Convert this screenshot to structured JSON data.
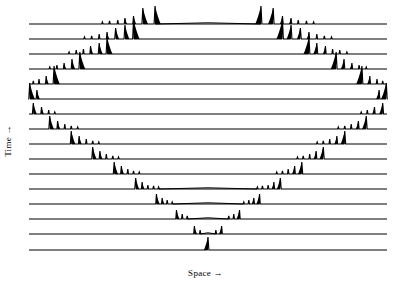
{
  "figure": {
    "title": "",
    "background_color": "#ffffff",
    "line_color": "#000000"
  },
  "axes": {
    "x_label": "Space →",
    "y_label": "Time →",
    "x_tick_labels": [],
    "y_tick_labels": [],
    "grid": false
  },
  "chart_data": {
    "type": "line",
    "title": "",
    "subtitle": "",
    "xlabel": "Space →",
    "ylabel": "Time →",
    "legend": [],
    "legend_position": "none",
    "xlim": [
      0,
      1
    ],
    "ylim": [
      0,
      16
    ],
    "grid": false,
    "n_traces": 16,
    "trace_order": "bottom row is earliest time; top row is latest time",
    "x_domain_px": [
      29,
      387
    ],
    "baseline_y_px": [
      24,
      39,
      54,
      69,
      84,
      99,
      114,
      129,
      144,
      159,
      174,
      189,
      204,
      219,
      234,
      250
    ],
    "max_spike_px": 22,
    "traces": [
      {
        "index": 0,
        "time_step": 15,
        "baseline_y": 24,
        "spikes": [
          {
            "x": 0.205,
            "h": 2
          },
          {
            "x": 0.225,
            "h": 3
          },
          {
            "x": 0.248,
            "h": 4
          },
          {
            "x": 0.268,
            "h": 6
          },
          {
            "x": 0.292,
            "h": 8
          },
          {
            "x": 0.318,
            "h": 16
          },
          {
            "x": 0.352,
            "h": 18
          },
          {
            "x": 0.648,
            "h": 18
          },
          {
            "x": 0.682,
            "h": 16
          },
          {
            "x": 0.708,
            "h": 8
          },
          {
            "x": 0.732,
            "h": 6
          },
          {
            "x": 0.752,
            "h": 4
          },
          {
            "x": 0.775,
            "h": 3
          },
          {
            "x": 0.795,
            "h": 2
          }
        ]
      },
      {
        "index": 1,
        "time_step": 14,
        "baseline_y": 39,
        "spikes": [
          {
            "x": 0.155,
            "h": 2
          },
          {
            "x": 0.175,
            "h": 3
          },
          {
            "x": 0.196,
            "h": 5
          },
          {
            "x": 0.218,
            "h": 7
          },
          {
            "x": 0.242,
            "h": 11
          },
          {
            "x": 0.268,
            "h": 14
          },
          {
            "x": 0.292,
            "h": 19
          },
          {
            "x": 0.708,
            "h": 19
          },
          {
            "x": 0.732,
            "h": 14
          },
          {
            "x": 0.758,
            "h": 11
          },
          {
            "x": 0.782,
            "h": 7
          },
          {
            "x": 0.804,
            "h": 5
          },
          {
            "x": 0.825,
            "h": 3
          },
          {
            "x": 0.845,
            "h": 2
          }
        ]
      },
      {
        "index": 2,
        "time_step": 13,
        "baseline_y": 54,
        "spikes": [
          {
            "x": 0.112,
            "h": 2
          },
          {
            "x": 0.132,
            "h": 4
          },
          {
            "x": 0.152,
            "h": 5
          },
          {
            "x": 0.172,
            "h": 8
          },
          {
            "x": 0.196,
            "h": 11
          },
          {
            "x": 0.218,
            "h": 17
          },
          {
            "x": 0.782,
            "h": 17
          },
          {
            "x": 0.804,
            "h": 11
          },
          {
            "x": 0.828,
            "h": 8
          },
          {
            "x": 0.848,
            "h": 5
          },
          {
            "x": 0.868,
            "h": 4
          },
          {
            "x": 0.888,
            "h": 2
          }
        ]
      },
      {
        "index": 3,
        "time_step": 12,
        "baseline_y": 69,
        "spikes": [
          {
            "x": 0.058,
            "h": 2
          },
          {
            "x": 0.078,
            "h": 4
          },
          {
            "x": 0.098,
            "h": 6
          },
          {
            "x": 0.12,
            "h": 10
          },
          {
            "x": 0.142,
            "h": 17
          },
          {
            "x": 0.858,
            "h": 17
          },
          {
            "x": 0.88,
            "h": 10
          },
          {
            "x": 0.902,
            "h": 6
          },
          {
            "x": 0.922,
            "h": 4
          },
          {
            "x": 0.942,
            "h": 2
          }
        ]
      },
      {
        "index": 4,
        "time_step": 11,
        "baseline_y": 84,
        "spikes": [
          {
            "x": 0.012,
            "h": 3
          },
          {
            "x": 0.028,
            "h": 5
          },
          {
            "x": 0.048,
            "h": 8
          },
          {
            "x": 0.07,
            "h": 18
          },
          {
            "x": 0.93,
            "h": 18
          },
          {
            "x": 0.952,
            "h": 8
          },
          {
            "x": 0.972,
            "h": 5
          },
          {
            "x": 0.988,
            "h": 3
          }
        ]
      },
      {
        "index": 5,
        "time_step": 10,
        "baseline_y": 99,
        "spikes": [
          {
            "x": 0.002,
            "h": 16
          },
          {
            "x": 0.022,
            "h": 9
          },
          {
            "x": 0.978,
            "h": 9
          },
          {
            "x": 0.998,
            "h": 16
          }
        ]
      },
      {
        "index": 6,
        "time_step": 9,
        "baseline_y": 114,
        "spikes": [
          {
            "x": 0.012,
            "h": 11
          },
          {
            "x": 0.035,
            "h": 7
          },
          {
            "x": 0.055,
            "h": 4
          },
          {
            "x": 0.072,
            "h": 2
          },
          {
            "x": 0.928,
            "h": 2
          },
          {
            "x": 0.945,
            "h": 4
          },
          {
            "x": 0.965,
            "h": 7
          },
          {
            "x": 0.988,
            "h": 11
          }
        ]
      },
      {
        "index": 7,
        "time_step": 8,
        "baseline_y": 129,
        "spikes": [
          {
            "x": 0.058,
            "h": 13
          },
          {
            "x": 0.08,
            "h": 8
          },
          {
            "x": 0.1,
            "h": 5
          },
          {
            "x": 0.118,
            "h": 3
          },
          {
            "x": 0.136,
            "h": 2
          },
          {
            "x": 0.864,
            "h": 2
          },
          {
            "x": 0.882,
            "h": 3
          },
          {
            "x": 0.9,
            "h": 5
          },
          {
            "x": 0.92,
            "h": 8
          },
          {
            "x": 0.942,
            "h": 13
          }
        ]
      },
      {
        "index": 8,
        "time_step": 7,
        "baseline_y": 144,
        "spikes": [
          {
            "x": 0.118,
            "h": 13
          },
          {
            "x": 0.14,
            "h": 8
          },
          {
            "x": 0.16,
            "h": 5
          },
          {
            "x": 0.178,
            "h": 3
          },
          {
            "x": 0.195,
            "h": 2
          },
          {
            "x": 0.805,
            "h": 2
          },
          {
            "x": 0.822,
            "h": 3
          },
          {
            "x": 0.84,
            "h": 5
          },
          {
            "x": 0.86,
            "h": 8
          },
          {
            "x": 0.882,
            "h": 13
          }
        ]
      },
      {
        "index": 9,
        "time_step": 6,
        "baseline_y": 159,
        "spikes": [
          {
            "x": 0.178,
            "h": 12
          },
          {
            "x": 0.198,
            "h": 8
          },
          {
            "x": 0.216,
            "h": 5
          },
          {
            "x": 0.234,
            "h": 3
          },
          {
            "x": 0.25,
            "h": 2
          },
          {
            "x": 0.75,
            "h": 2
          },
          {
            "x": 0.766,
            "h": 3
          },
          {
            "x": 0.784,
            "h": 5
          },
          {
            "x": 0.802,
            "h": 8
          },
          {
            "x": 0.822,
            "h": 12
          }
        ]
      },
      {
        "index": 10,
        "time_step": 5,
        "baseline_y": 174,
        "spikes": [
          {
            "x": 0.238,
            "h": 12
          },
          {
            "x": 0.258,
            "h": 8
          },
          {
            "x": 0.276,
            "h": 5
          },
          {
            "x": 0.292,
            "h": 3
          },
          {
            "x": 0.308,
            "h": 2
          },
          {
            "x": 0.692,
            "h": 2
          },
          {
            "x": 0.708,
            "h": 3
          },
          {
            "x": 0.724,
            "h": 5
          },
          {
            "x": 0.742,
            "h": 8
          },
          {
            "x": 0.762,
            "h": 12
          }
        ]
      },
      {
        "index": 11,
        "time_step": 4,
        "baseline_y": 189,
        "spikes": [
          {
            "x": 0.298,
            "h": 11
          },
          {
            "x": 0.316,
            "h": 7
          },
          {
            "x": 0.332,
            "h": 4
          },
          {
            "x": 0.348,
            "h": 3
          },
          {
            "x": 0.362,
            "h": 2
          },
          {
            "x": 0.638,
            "h": 2
          },
          {
            "x": 0.652,
            "h": 3
          },
          {
            "x": 0.668,
            "h": 4
          },
          {
            "x": 0.684,
            "h": 7
          },
          {
            "x": 0.702,
            "h": 11
          }
        ]
      },
      {
        "index": 12,
        "time_step": 3,
        "baseline_y": 204,
        "spikes": [
          {
            "x": 0.356,
            "h": 10
          },
          {
            "x": 0.372,
            "h": 6
          },
          {
            "x": 0.386,
            "h": 4
          },
          {
            "x": 0.4,
            "h": 2
          },
          {
            "x": 0.6,
            "h": 2
          },
          {
            "x": 0.614,
            "h": 4
          },
          {
            "x": 0.628,
            "h": 6
          },
          {
            "x": 0.644,
            "h": 10
          }
        ]
      },
      {
        "index": 13,
        "time_step": 2,
        "baseline_y": 219,
        "spikes": [
          {
            "x": 0.412,
            "h": 9
          },
          {
            "x": 0.428,
            "h": 5
          },
          {
            "x": 0.442,
            "h": 3
          },
          {
            "x": 0.558,
            "h": 3
          },
          {
            "x": 0.572,
            "h": 5
          },
          {
            "x": 0.588,
            "h": 9
          }
        ]
      },
      {
        "index": 14,
        "time_step": 1,
        "baseline_y": 234,
        "spikes": [
          {
            "x": 0.462,
            "h": 8
          },
          {
            "x": 0.478,
            "h": 4
          },
          {
            "x": 0.522,
            "h": 4
          },
          {
            "x": 0.538,
            "h": 8
          }
        ]
      },
      {
        "index": 15,
        "time_step": 0,
        "baseline_y": 250,
        "spikes": [
          {
            "x": 0.5,
            "h": 13
          }
        ]
      }
    ]
  }
}
